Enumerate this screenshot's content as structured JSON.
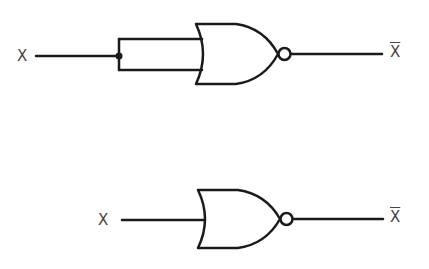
{
  "diagram": {
    "stroke_color": "#1a1a1a",
    "label_color": "#444444",
    "circuits": [
      {
        "name": "nor-gate-with-tied-inputs",
        "input_label": "X",
        "output_label": "X",
        "output_inverted": true,
        "inputs_tied": true
      },
      {
        "name": "nor-gate-single-input",
        "input_label": "X",
        "output_label": "X",
        "output_inverted": true,
        "inputs_tied": false
      }
    ]
  }
}
